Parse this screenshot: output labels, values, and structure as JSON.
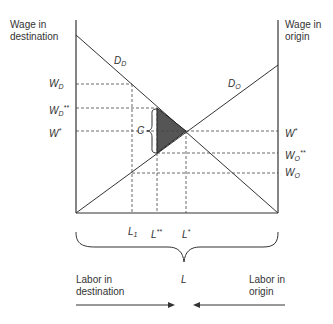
{
  "axes": {
    "left_title_line1": "Wage in",
    "left_title_line2": "destination",
    "right_title_line1": "Wage in",
    "right_title_line2": "origin"
  },
  "curves": {
    "demand_destination": {
      "base": "D",
      "sub": "D"
    },
    "demand_origin": {
      "base": "D",
      "sub": "O"
    }
  },
  "left_wage_labels": [
    {
      "base": "W",
      "sub": "D",
      "sup": ""
    },
    {
      "base": "W",
      "sub": "D",
      "sup": "**"
    },
    {
      "base": "W",
      "sub": "",
      "sup": "*"
    }
  ],
  "right_wage_labels": [
    {
      "base": "W",
      "sub": "",
      "sup": "*"
    },
    {
      "base": "W",
      "sub": "O",
      "sup": "**"
    },
    {
      "base": "W",
      "sub": "O",
      "sup": ""
    }
  ],
  "labor_labels": [
    {
      "base": "L",
      "sub": "1",
      "sup": ""
    },
    {
      "base": "L",
      "sub": "",
      "sup": "**"
    },
    {
      "base": "L",
      "sub": "",
      "sup": "*"
    }
  ],
  "cost_label": "C",
  "total_labor_label": "L",
  "bottom": {
    "left_line1": "Labor in",
    "left_line2": "destination",
    "right_line1": "Labor in",
    "right_line2": "origin"
  },
  "colors": {
    "line": "#333333",
    "dash": "#444444",
    "triangle_fill": "#555555"
  }
}
